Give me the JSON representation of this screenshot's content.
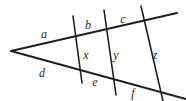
{
  "figure": {
    "name": "two-rays-cut-by-three-transversals",
    "width": 186,
    "height": 101,
    "background_color": "#ffffff",
    "stroke_color": "#1f1f1f",
    "label_color": "#262626"
  },
  "labels": {
    "a": "a",
    "b": "b",
    "c": "c",
    "d": "d",
    "e": "e",
    "f": "f",
    "x": "x",
    "y": "y",
    "z": "z"
  },
  "label_positions": {
    "a": {
      "x": 44,
      "y": 34
    },
    "b": {
      "x": 88,
      "y": 25
    },
    "c": {
      "x": 123,
      "y": 19
    },
    "d": {
      "x": 42,
      "y": 73
    },
    "e": {
      "x": 95,
      "y": 82
    },
    "f": {
      "x": 133,
      "y": 93
    },
    "x": {
      "x": 86,
      "y": 55
    },
    "y": {
      "x": 116,
      "y": 55
    },
    "z": {
      "x": 155,
      "y": 55
    }
  },
  "lines": {
    "upper_ray": {
      "x1": 11,
      "y1": 51,
      "x2": 177,
      "y2": 13,
      "width": 2
    },
    "lower_ray": {
      "x1": 11,
      "y1": 51,
      "x2": 186,
      "y2": 99,
      "width": 2
    },
    "transversal_1": {
      "x1": 73,
      "y1": 16,
      "x2": 82,
      "y2": 83,
      "width": 1.6
    },
    "transversal_2": {
      "x1": 104,
      "y1": 10,
      "x2": 116,
      "y2": 95,
      "width": 1.6
    },
    "transversal_3": {
      "x1": 141,
      "y1": 6,
      "x2": 163,
      "y2": 101,
      "width": 1.6
    }
  }
}
